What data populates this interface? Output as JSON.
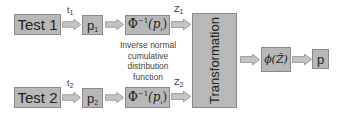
{
  "diagram": {
    "rows": [
      {
        "test_label": "Test 1",
        "t_label": "t",
        "t_sub": "1",
        "p_label": "p",
        "p_sub": "1",
        "phi_inv_label": "Φ",
        "phi_inv_sup": "−1",
        "phi_inv_arg": "(p",
        "phi_inv_arg_sub": "i",
        "phi_inv_close": ")",
        "z_label": "Z",
        "z_sub": "1"
      },
      {
        "test_label": "Test 2",
        "t_label": "t",
        "t_sub": "2",
        "p_label": "p",
        "p_sub": "2",
        "phi_inv_label": "Φ",
        "phi_inv_sup": "−1",
        "phi_inv_arg": "(p",
        "phi_inv_arg_sub": "i",
        "phi_inv_close": ")",
        "z_label": "Z",
        "z_sub": "2"
      }
    ],
    "caption_lines": [
      "Inverse normal",
      "cumulative",
      "distribution",
      "function"
    ],
    "transformation_label": "Transformation",
    "phi_label": "ϕ(Z̃)",
    "output_label": "p",
    "colors": {
      "box_fill": "#b8b8b8",
      "box_border": "#8a8a8a",
      "arrow_fill": "#c4c4c4",
      "arrow_border": "#8e8e8e"
    }
  }
}
